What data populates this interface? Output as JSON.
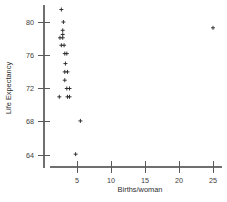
{
  "chart_data": {
    "type": "scatter",
    "title": "",
    "subtitle": "",
    "xlabel": "Births/woman",
    "ylabel": "Life Expectancy",
    "xlim": [
      1.0,
      26.5
    ],
    "ylim": [
      62.5,
      82.0
    ],
    "xticks": [
      5,
      10,
      15,
      20,
      25
    ],
    "yticks": [
      64,
      68,
      72,
      76,
      80
    ],
    "xtick_labels": [
      "5",
      "10",
      "15",
      "20",
      "25"
    ],
    "ytick_labels": [
      "64",
      "68",
      "72",
      "76",
      "80"
    ],
    "grid": false,
    "legend": null,
    "marker": "plus",
    "marker_color": "#2b2b2b",
    "axis_color": "#6f6f6f",
    "annotations": [],
    "points": [
      {
        "x": 2.7,
        "y": 81.5
      },
      {
        "x": 3.0,
        "y": 80.0
      },
      {
        "x": 2.9,
        "y": 79.0
      },
      {
        "x": 2.9,
        "y": 78.5
      },
      {
        "x": 2.5,
        "y": 78.1
      },
      {
        "x": 2.9,
        "y": 78.1
      },
      {
        "x": 2.7,
        "y": 77.2
      },
      {
        "x": 3.1,
        "y": 77.2
      },
      {
        "x": 3.2,
        "y": 76.2
      },
      {
        "x": 3.5,
        "y": 76.2
      },
      {
        "x": 3.3,
        "y": 75.0
      },
      {
        "x": 3.2,
        "y": 74.0
      },
      {
        "x": 3.6,
        "y": 74.0
      },
      {
        "x": 3.2,
        "y": 73.0
      },
      {
        "x": 3.5,
        "y": 72.0
      },
      {
        "x": 3.9,
        "y": 72.0
      },
      {
        "x": 2.4,
        "y": 71.0
      },
      {
        "x": 3.6,
        "y": 71.0
      },
      {
        "x": 3.9,
        "y": 71.0
      },
      {
        "x": 25.0,
        "y": 79.3
      },
      {
        "x": 5.5,
        "y": 68.1
      },
      {
        "x": 4.8,
        "y": 64.1
      }
    ]
  }
}
